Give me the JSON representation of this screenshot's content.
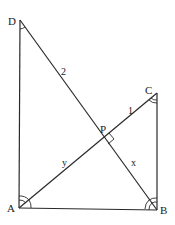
{
  "diagram": {
    "type": "geometry",
    "points": {
      "A": {
        "label": "A",
        "x": 19,
        "y": 208
      },
      "B": {
        "label": "B",
        "x": 157,
        "y": 210
      },
      "C": {
        "label": "C",
        "x": 157,
        "y": 93
      },
      "D": {
        "label": "D",
        "x": 20,
        "y": 20
      },
      "P": {
        "label": "P",
        "x": 103,
        "y": 137
      }
    },
    "segment_labels": {
      "DP": "2",
      "PC": "1",
      "AP": "y",
      "PB": "x"
    },
    "markers": {
      "right_angle_at": "P",
      "angle_D": "single arc",
      "angle_C": "double arc",
      "angle_A": "double arc",
      "angle_B": "double arc"
    }
  }
}
